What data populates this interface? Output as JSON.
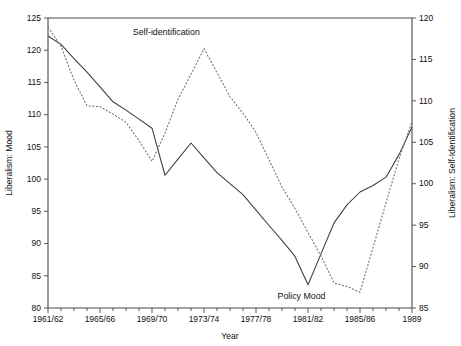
{
  "chart_data": {
    "type": "line",
    "title": "",
    "xlabel": "Year",
    "ylabel_left": "Liberalism: Mood",
    "ylabel_right": "Liberalism: Self-Identification",
    "grid": false,
    "legend_position": "inline-annotations",
    "x_tick_labels": [
      "1961/62",
      "1965/66",
      "1969/70",
      "1973/74",
      "1977/78",
      "1981/82",
      "1985/86",
      "1989"
    ],
    "x_tick_values": [
      1961,
      1965,
      1969,
      1973,
      1977,
      1981,
      1985,
      1989
    ],
    "x_minor_ticks": [
      1962,
      1963,
      1964,
      1966,
      1967,
      1968,
      1970,
      1971,
      1972,
      1974,
      1975,
      1976,
      1978,
      1979,
      1980,
      1982,
      1983,
      1984,
      1986,
      1987,
      1988
    ],
    "xlim": [
      1961,
      1989
    ],
    "y_left_ticks": [
      80,
      85,
      90,
      95,
      100,
      105,
      110,
      115,
      120,
      125
    ],
    "ylim_left": [
      80,
      125
    ],
    "y_right_ticks": [
      85,
      90,
      95,
      100,
      105,
      110,
      115,
      120
    ],
    "ylim_right": [
      85,
      120
    ],
    "series": [
      {
        "name": "Policy Mood",
        "axis": "left",
        "style": "solid",
        "annotation": "Policy Mood",
        "annotation_x": 1980.5,
        "annotation_y": 81.4,
        "x": [
          1961,
          1962,
          1963,
          1964,
          1965,
          1966,
          1967,
          1968,
          1969,
          1970,
          1971,
          1972,
          1973,
          1974,
          1975,
          1976,
          1977,
          1978,
          1979,
          1980,
          1981,
          1982,
          1983,
          1984,
          1985,
          1986,
          1987,
          1988,
          1989
        ],
        "values": [
          122.2,
          120.9,
          118.7,
          116.6,
          114.3,
          112.0,
          110.7,
          109.3,
          107.9,
          100.6,
          103.1,
          105.6,
          103.3,
          101.0,
          99.3,
          97.6,
          95.2,
          92.8,
          90.5,
          88.0,
          83.6,
          88.4,
          93.2,
          96.0,
          98.0,
          99.0,
          100.3,
          103.8,
          108.1
        ]
      },
      {
        "name": "Self-identification",
        "axis": "right",
        "style": "dotted",
        "annotation": "Self-identification",
        "annotation_x": 1970.1,
        "annotation_y": 118.0,
        "x": [
          1961,
          1962,
          1963,
          1964,
          1965,
          1966,
          1967,
          1968,
          1969,
          1970,
          1971,
          1972,
          1973,
          1974,
          1975,
          1976,
          1977,
          1978,
          1979,
          1980,
          1981,
          1982,
          1983,
          1984,
          1985,
          1986,
          1987,
          1988,
          1989
        ],
        "values": [
          118.9,
          116.6,
          112.5,
          109.4,
          109.3,
          108.4,
          107.4,
          105.2,
          102.7,
          106.1,
          110.2,
          113.2,
          116.3,
          113.4,
          110.5,
          108.5,
          106.2,
          102.9,
          99.6,
          97.0,
          94.1,
          91.3,
          88.0,
          87.6,
          86.9,
          92.3,
          97.7,
          103.0,
          107.5
        ]
      }
    ]
  },
  "axes": {
    "x_title": "Year",
    "y_left_title": "Liberalism: Mood",
    "y_right_title": "Liberalism: Self-Identification"
  }
}
